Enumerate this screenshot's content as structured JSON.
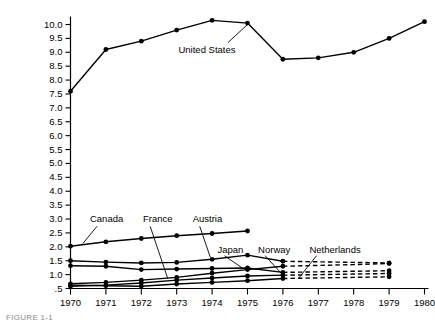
{
  "chart_data": {
    "type": "line",
    "title": "",
    "xlabel": "",
    "ylabel": "",
    "x": [
      1970,
      1971,
      1972,
      1973,
      1974,
      1975,
      1976,
      1977,
      1978,
      1979,
      1980
    ],
    "xtick_labels": [
      "1970",
      "1971",
      "1972",
      "1973",
      "1974",
      "1975",
      "1976",
      "1977",
      "1978",
      "1979",
      "1980"
    ],
    "ytick_labels": [
      "10.0",
      "9.5",
      "9.0",
      "8.5",
      "8.0",
      "7.5",
      "7.0",
      "6.5",
      "6.0",
      "5.5",
      "5.0",
      "4.5",
      "4.0",
      "3.5",
      "3.0",
      "2.5",
      "2.0",
      "1.5",
      "1.0",
      ".5"
    ],
    "ytick_values": [
      10.0,
      9.5,
      9.0,
      8.5,
      8.0,
      7.5,
      7.0,
      6.5,
      6.0,
      5.5,
      5.0,
      4.5,
      4.0,
      3.5,
      3.0,
      2.5,
      2.0,
      1.5,
      1.0,
      0.5
    ],
    "ylim": [
      0.5,
      10.25
    ],
    "xlim": [
      1970,
      1980
    ],
    "grid": false,
    "legend": "inline-labels",
    "series": [
      {
        "name": "United States",
        "label": "United States",
        "x": [
          1970,
          1971,
          1972,
          1973,
          1974,
          1975,
          1976,
          1977,
          1978,
          1979,
          1980
        ],
        "values": [
          7.6,
          9.1,
          9.4,
          9.8,
          10.15,
          10.05,
          8.75,
          8.8,
          9.0,
          9.5,
          10.1
        ],
        "dashed_from": null,
        "label_pos": {
          "x": 1973.05,
          "y": 9.05
        },
        "leader": {
          "x1": 1974.45,
          "y1": 9.35,
          "x2": 1975.0,
          "y2": 10.0
        }
      },
      {
        "name": "Canada",
        "label": "Canada",
        "x": [
          1970,
          1971,
          1972,
          1973,
          1974,
          1975
        ],
        "values": [
          2.02,
          2.18,
          2.3,
          2.4,
          2.48,
          2.57
        ],
        "dashed_from": null,
        "label_pos": {
          "x": 1970.55,
          "y": 2.98
        },
        "leader": {
          "x1": 1970.75,
          "y1": 2.74,
          "x2": 1970.35,
          "y2": 2.12
        }
      },
      {
        "name": "France",
        "label": "France",
        "x": [
          1970,
          1971,
          1972,
          1973,
          1974,
          1975,
          1976,
          1977,
          1978,
          1979
        ],
        "values": [
          0.67,
          0.72,
          0.8,
          0.9,
          1.05,
          1.18,
          1.3,
          1.33,
          1.36,
          1.4
        ],
        "dashed_from": 1976,
        "label_pos": {
          "x": 1972.05,
          "y": 2.98
        },
        "leader": {
          "x1": 1972.25,
          "y1": 2.74,
          "x2": 1972.75,
          "y2": 0.85
        }
      },
      {
        "name": "Austria",
        "label": "Austria",
        "x": [
          1970,
          1971,
          1972,
          1973,
          1974,
          1975,
          1976,
          1977,
          1978,
          1979
        ],
        "values": [
          1.5,
          1.45,
          1.42,
          1.44,
          1.55,
          1.7,
          1.48,
          1.46,
          1.44,
          1.42
        ],
        "dashed_from": 1976,
        "label_pos": {
          "x": 1973.45,
          "y": 2.98
        },
        "leader": {
          "x1": 1973.65,
          "y1": 2.74,
          "x2": 1973.95,
          "y2": 1.62
        }
      },
      {
        "name": "Japan",
        "label": "Japan",
        "x": [
          1970,
          1971,
          1972,
          1973,
          1974,
          1975,
          1976,
          1977,
          1978,
          1979
        ],
        "values": [
          1.32,
          1.3,
          1.18,
          1.2,
          1.22,
          1.24,
          1.08,
          1.1,
          1.12,
          1.14
        ],
        "dashed_from": 1976,
        "label_pos": {
          "x": 1974.15,
          "y": 1.88
        },
        "leader": {
          "x1": 1974.35,
          "y1": 1.68,
          "x2": 1974.85,
          "y2": 1.24
        }
      },
      {
        "name": "Norway",
        "label": "Norway",
        "x": [
          1970,
          1971,
          1972,
          1973,
          1974,
          1975,
          1976,
          1977,
          1978,
          1979
        ],
        "values": [
          0.58,
          0.62,
          0.7,
          0.8,
          0.88,
          0.95,
          0.98,
          1.0,
          1.02,
          1.04
        ],
        "dashed_from": 1976,
        "label_pos": {
          "x": 1975.3,
          "y": 1.88
        },
        "leader": {
          "x1": 1975.5,
          "y1": 1.68,
          "x2": 1976.0,
          "y2": 0.98
        }
      },
      {
        "name": "Netherlands",
        "label": "Netherlands",
        "x": [
          1970,
          1971,
          1972,
          1973,
          1974,
          1975,
          1976,
          1977,
          1978,
          1979
        ],
        "values": [
          0.62,
          0.6,
          0.58,
          0.66,
          0.72,
          0.78,
          0.86,
          0.88,
          0.9,
          0.92
        ],
        "dashed_from": 1976,
        "label_pos": {
          "x": 1976.75,
          "y": 1.88
        },
        "leader": {
          "x1": 1976.95,
          "y1": 1.68,
          "x2": 1976.45,
          "y2": 0.88
        }
      }
    ]
  },
  "caption": {
    "text": "FIGURE 1-1"
  }
}
